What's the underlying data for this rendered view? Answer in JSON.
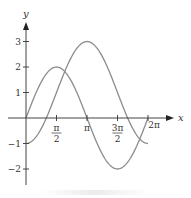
{
  "chart_data": {
    "type": "line",
    "title": "",
    "xlabel": "x",
    "ylabel": "y",
    "xlim": [
      0,
      6.2832
    ],
    "ylim": [
      -2,
      3
    ],
    "grid": false,
    "legend": null,
    "x_ticks": [
      {
        "value": 1.5708,
        "label_num": "π",
        "label_den": "2"
      },
      {
        "value": 3.1416,
        "label": "π"
      },
      {
        "value": 4.7124,
        "label_num": "3π",
        "label_den": "2"
      },
      {
        "value": 6.2832,
        "label": "2π"
      }
    ],
    "y_ticks": [
      {
        "value": 3,
        "label": "3"
      },
      {
        "value": 2,
        "label": "2"
      },
      {
        "value": 1,
        "label": "1"
      },
      {
        "value": -1,
        "label": "−1"
      },
      {
        "value": -2,
        "label": "−2"
      }
    ],
    "series": [
      {
        "name": "y = 2 sin x",
        "x": [
          0,
          0.7854,
          1.5708,
          2.3562,
          3.1416,
          3.927,
          4.7124,
          5.4978,
          6.2832
        ],
        "values": [
          0,
          1.414,
          2,
          1.414,
          0,
          -1.414,
          -2,
          -1.414,
          0
        ]
      },
      {
        "name": "y = 1 − 2 cos x",
        "x": [
          0,
          0.7854,
          1.5708,
          2.3562,
          3.1416,
          3.927,
          4.7124,
          5.4978,
          6.2832
        ],
        "values": [
          -1,
          -0.414,
          1,
          2.414,
          3,
          2.414,
          1,
          -0.414,
          -1
        ]
      }
    ]
  },
  "colors": {
    "axis": "#444444",
    "curve": "#8c8c8c"
  }
}
